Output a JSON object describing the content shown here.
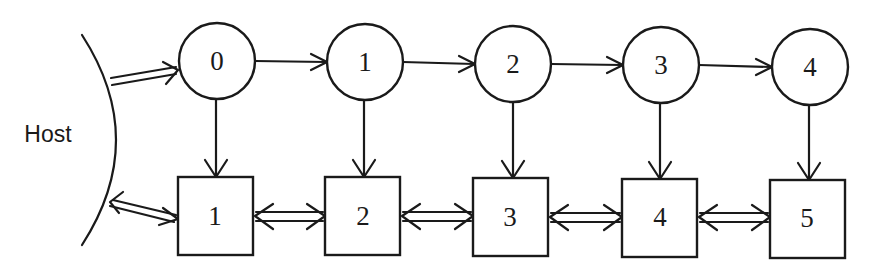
{
  "diagram": {
    "host_label": "Host",
    "nodes": [
      {
        "label": "0",
        "cx": 217,
        "cy": 61
      },
      {
        "label": "1",
        "cx": 365,
        "cy": 62
      },
      {
        "label": "2",
        "cx": 513,
        "cy": 64
      },
      {
        "label": "3",
        "cx": 661,
        "cy": 65
      },
      {
        "label": "4",
        "cx": 810,
        "cy": 67
      }
    ],
    "boxes": [
      {
        "label": "1",
        "x": 178,
        "y": 177
      },
      {
        "label": "2",
        "x": 325,
        "y": 177
      },
      {
        "label": "3",
        "x": 473,
        "y": 178
      },
      {
        "label": "4",
        "x": 622,
        "y": 179
      },
      {
        "label": "5",
        "x": 770,
        "y": 180
      }
    ],
    "colors": {
      "line": "#1a1a1a",
      "background": "#ffffff"
    }
  }
}
